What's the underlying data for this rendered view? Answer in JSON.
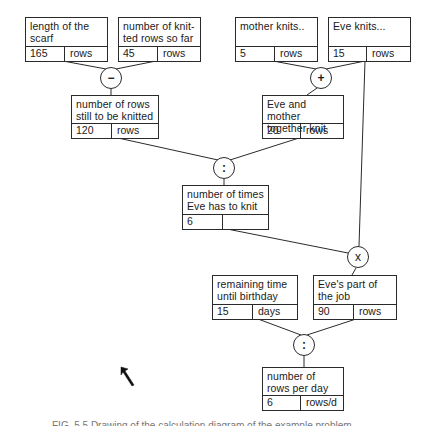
{
  "diagram": {
    "boxes": [
      {
        "id": "A",
        "label": "length of the scarf",
        "value": "165",
        "unit": "rows"
      },
      {
        "id": "B",
        "label": "number of knit-ted rows so far",
        "value": "45",
        "unit": "rows"
      },
      {
        "id": "C",
        "label": "number of rows still to be knitted",
        "value": "120",
        "unit": "rows"
      },
      {
        "id": "D",
        "label": "mother knits..",
        "value": "5",
        "unit": "rows"
      },
      {
        "id": "E",
        "label": "Eve knits...",
        "value": "15",
        "unit": "rows"
      },
      {
        "id": "F",
        "label": "Eve and mother together knit",
        "value": "20",
        "unit": "rows"
      },
      {
        "id": "G",
        "label": "number of times Eve has to knit",
        "value": "6",
        "unit": ""
      },
      {
        "id": "H",
        "label": "remaining time until birthday",
        "value": "15",
        "unit": "days"
      },
      {
        "id": "I",
        "label": "Eve's part of the job",
        "value": "90",
        "unit": "rows"
      },
      {
        "id": "J",
        "label": "number of rows per day",
        "value": "6",
        "unit": "rows/d"
      }
    ],
    "operators": [
      {
        "id": "minus",
        "symbol": "−",
        "inputs": [
          "A",
          "B"
        ],
        "output": "C"
      },
      {
        "id": "plus",
        "symbol": "+",
        "inputs": [
          "D",
          "E"
        ],
        "output": "F"
      },
      {
        "id": "divide1",
        "symbol": ":",
        "inputs": [
          "C",
          "F"
        ],
        "output": "G"
      },
      {
        "id": "multiply",
        "symbol": "x",
        "inputs": [
          "G",
          "E"
        ],
        "output": "I"
      },
      {
        "id": "divide2",
        "symbol": ":",
        "inputs": [
          "H",
          "I"
        ],
        "output": "J"
      }
    ],
    "caption": "FIG. 5.5   Drawing of the calculation diagram of the example problem"
  }
}
